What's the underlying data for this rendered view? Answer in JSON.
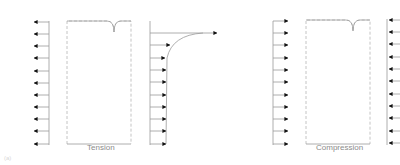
{
  "figure": {
    "panel_label": "(a)",
    "colors": {
      "line": "#9a9a9a",
      "arrow": "#111111",
      "dashed": "#b5b5b5",
      "text": "#8a8a8a"
    },
    "panels": [
      {
        "name": "tension",
        "caption": "Tension",
        "left_arrows": "inward-left",
        "arrow_count": 11
      },
      {
        "name": "flow-profile",
        "caption": "",
        "arrow_count": 10,
        "flow_arrow": "right"
      },
      {
        "name": "compression",
        "caption": "Compression",
        "left_arrows": "right",
        "right_arrows": "left",
        "arrow_count": 11
      }
    ]
  }
}
